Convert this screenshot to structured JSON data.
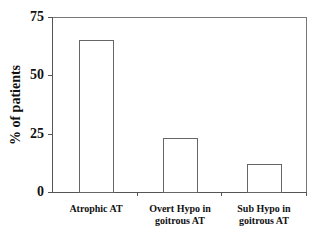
{
  "chart_data": {
    "type": "bar",
    "title": "",
    "xlabel": "",
    "ylabel": "% of patients",
    "ylim": [
      0,
      75
    ],
    "yticks": [
      "0",
      "25",
      "50",
      "75"
    ],
    "categories": [
      "Atrophic AT",
      "Overt Hypo in goitrous AT",
      "Sub Hypo in goitrous AT"
    ],
    "category_lines": [
      [
        "Atrophic AT"
      ],
      [
        "Overt Hypo in",
        "goitrous AT"
      ],
      [
        "Sub Hypo in",
        "goitrous AT"
      ]
    ],
    "values": [
      65,
      23,
      12
    ],
    "grid": false,
    "legend": null,
    "bar_style": {
      "fill": "#ffffff",
      "stroke": "#666666"
    }
  }
}
